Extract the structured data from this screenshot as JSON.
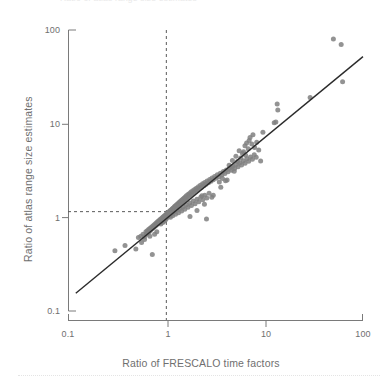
{
  "figure": {
    "top_fragment_text": "Ratio of atlas range size estimates",
    "background_color": "#ffffff",
    "point_color": "#808080",
    "line_color": "#2b2b2b",
    "axis_color": "#7a7a7a",
    "text_color": "#6f6f6f",
    "reference_line_color": "#5a5a5a",
    "separator_color": "#e4e4e4"
  },
  "axes": {
    "y": {
      "title": "Ratio of atlas range size estimates",
      "ticks": [
        "100",
        "10",
        "1",
        "0.1"
      ],
      "tick_values": [
        100,
        10,
        1,
        0.1
      ],
      "scale": "log"
    },
    "x": {
      "title": "Ratio of FRESCALO time factors",
      "ticks": [
        "0.1",
        "1",
        "10",
        "100"
      ],
      "tick_values": [
        0.1,
        1,
        10,
        100
      ],
      "scale": "log"
    }
  },
  "chart_data": {
    "type": "scatter",
    "title": "",
    "subtitle": "",
    "xlabel": "Ratio of FRESCALO time factors",
    "ylabel": "Ratio of atlas range size estimates",
    "xscale": "log",
    "yscale": "log",
    "xlim": [
      0.1,
      100
    ],
    "ylim": [
      0.1,
      100
    ],
    "xticks": [
      0.1,
      1,
      10,
      100
    ],
    "yticks": [
      0.1,
      1,
      10,
      100
    ],
    "xticklabels": [
      "0.1",
      "1",
      "10",
      "100"
    ],
    "yticklabels": [
      "0.1",
      "1",
      "10",
      "100"
    ],
    "grid": false,
    "legend": null,
    "marker": {
      "shape": "circle",
      "color": "#808080",
      "size": 5,
      "alpha": 0.85
    },
    "annotations": [
      {
        "kind": "vline",
        "x": 1,
        "style": "dashed",
        "color": "#5a5a5a"
      },
      {
        "kind": "hline",
        "y": 1.15,
        "style": "dashed",
        "color": "#5a5a5a",
        "x_to": 1
      }
    ],
    "fit_line": {
      "kind": "line",
      "style": "solid",
      "color": "#2b2b2b",
      "x": [
        0.12,
        100
      ],
      "y": [
        0.155,
        52
      ]
    },
    "series": [
      {
        "name": "species",
        "n_points": 214,
        "points": [
          [
            0.3,
            0.44
          ],
          [
            0.38,
            0.5
          ],
          [
            0.49,
            0.46
          ],
          [
            0.72,
            0.4
          ],
          [
            0.52,
            0.61
          ],
          [
            0.55,
            0.63
          ],
          [
            0.58,
            0.66
          ],
          [
            0.6,
            0.62
          ],
          [
            0.62,
            0.7
          ],
          [
            0.63,
            0.66
          ],
          [
            0.64,
            0.72
          ],
          [
            0.65,
            0.68
          ],
          [
            0.66,
            0.74
          ],
          [
            0.67,
            0.7
          ],
          [
            0.68,
            0.76
          ],
          [
            0.69,
            0.73
          ],
          [
            0.7,
            0.78
          ],
          [
            0.71,
            0.75
          ],
          [
            0.72,
            0.8
          ],
          [
            0.73,
            0.77
          ],
          [
            0.74,
            0.82
          ],
          [
            0.75,
            0.79
          ],
          [
            0.76,
            0.84
          ],
          [
            0.77,
            0.81
          ],
          [
            0.78,
            0.86
          ],
          [
            0.79,
            0.83
          ],
          [
            0.8,
            0.88
          ],
          [
            0.81,
            0.85
          ],
          [
            0.82,
            0.9
          ],
          [
            0.83,
            0.87
          ],
          [
            0.84,
            0.92
          ],
          [
            0.85,
            0.89
          ],
          [
            0.86,
            0.94
          ],
          [
            0.87,
            0.91
          ],
          [
            0.88,
            0.96
          ],
          [
            0.89,
            0.93
          ],
          [
            0.9,
            0.98
          ],
          [
            0.91,
            0.95
          ],
          [
            0.92,
            1.0
          ],
          [
            0.93,
            0.97
          ],
          [
            0.94,
            1.02
          ],
          [
            0.95,
            0.99
          ],
          [
            0.96,
            1.04
          ],
          [
            0.97,
            1.01
          ],
          [
            0.98,
            1.06
          ],
          [
            0.99,
            1.03
          ],
          [
            1.0,
            1.08
          ],
          [
            1.01,
            1.05
          ],
          [
            1.02,
            1.1
          ],
          [
            1.03,
            1.07
          ],
          [
            1.04,
            1.12
          ],
          [
            1.05,
            1.09
          ],
          [
            1.06,
            1.14
          ],
          [
            1.07,
            1.11
          ],
          [
            1.08,
            1.16
          ],
          [
            1.09,
            1.13
          ],
          [
            1.1,
            1.18
          ],
          [
            1.11,
            1.15
          ],
          [
            1.12,
            1.2
          ],
          [
            1.13,
            1.17
          ],
          [
            1.14,
            1.22
          ],
          [
            1.15,
            1.19
          ],
          [
            1.16,
            1.24
          ],
          [
            1.17,
            1.21
          ],
          [
            1.18,
            1.26
          ],
          [
            1.19,
            1.23
          ],
          [
            1.2,
            1.28
          ],
          [
            1.21,
            1.25
          ],
          [
            1.22,
            1.31
          ],
          [
            1.23,
            1.27
          ],
          [
            1.25,
            1.34
          ],
          [
            1.26,
            1.3
          ],
          [
            1.28,
            1.37
          ],
          [
            1.29,
            1.32
          ],
          [
            1.31,
            1.4
          ],
          [
            1.32,
            1.35
          ],
          [
            1.34,
            1.43
          ],
          [
            1.35,
            1.38
          ],
          [
            1.37,
            1.46
          ],
          [
            1.38,
            1.41
          ],
          [
            1.4,
            1.49
          ],
          [
            1.42,
            1.44
          ],
          [
            1.44,
            1.53
          ],
          [
            1.46,
            1.47
          ],
          [
            1.48,
            1.57
          ],
          [
            1.5,
            1.51
          ],
          [
            1.52,
            1.61
          ],
          [
            1.54,
            1.55
          ],
          [
            1.56,
            1.65
          ],
          [
            1.58,
            1.59
          ],
          [
            1.6,
            1.7
          ],
          [
            1.63,
            1.63
          ],
          [
            1.66,
            1.75
          ],
          [
            1.69,
            1.68
          ],
          [
            1.72,
            1.8
          ],
          [
            1.75,
            1.73
          ],
          [
            1.78,
            1.86
          ],
          [
            1.82,
            1.78
          ],
          [
            1.86,
            1.92
          ],
          [
            1.9,
            1.84
          ],
          [
            1.94,
            1.98
          ],
          [
            1.98,
            1.9
          ],
          [
            2.02,
            2.05
          ],
          [
            2.07,
            1.96
          ],
          [
            2.12,
            2.12
          ],
          [
            2.17,
            2.03
          ],
          [
            2.22,
            2.2
          ],
          [
            2.28,
            2.1
          ],
          [
            2.34,
            2.28
          ],
          [
            2.4,
            2.18
          ],
          [
            2.46,
            2.36
          ],
          [
            2.53,
            2.26
          ],
          [
            2.6,
            2.45
          ],
          [
            2.68,
            2.34
          ],
          [
            2.76,
            2.54
          ],
          [
            2.84,
            2.43
          ],
          [
            2.92,
            2.63
          ],
          [
            3.0,
            2.52
          ],
          [
            3.1,
            2.73
          ],
          [
            3.2,
            2.62
          ],
          [
            3.3,
            2.84
          ],
          [
            3.42,
            2.72
          ],
          [
            3.54,
            2.96
          ],
          [
            3.66,
            2.83
          ],
          [
            3.8,
            3.08
          ],
          [
            3.94,
            2.94
          ],
          [
            4.08,
            3.21
          ],
          [
            4.24,
            3.06
          ],
          [
            4.4,
            3.35
          ],
          [
            4.58,
            3.18
          ],
          [
            4.76,
            3.5
          ],
          [
            4.95,
            3.32
          ],
          [
            5.15,
            3.66
          ],
          [
            5.36,
            3.46
          ],
          [
            5.58,
            3.83
          ],
          [
            5.82,
            3.61
          ],
          [
            6.06,
            4.01
          ],
          [
            6.32,
            3.78
          ],
          [
            6.6,
            4.21
          ],
          [
            6.88,
            3.96
          ],
          [
            7.18,
            4.42
          ],
          [
            7.5,
            4.16
          ],
          [
            7.84,
            4.65
          ],
          [
            8.2,
            4.37
          ],
          [
            0.88,
            0.85
          ],
          [
            0.92,
            0.88
          ],
          [
            0.95,
            0.91
          ],
          [
            0.98,
            0.94
          ],
          [
            1.0,
            0.97
          ],
          [
            1.02,
            1.0
          ],
          [
            1.05,
            1.03
          ],
          [
            1.08,
            1.06
          ],
          [
            1.1,
            1.0
          ],
          [
            1.13,
            1.1
          ],
          [
            1.16,
            1.04
          ],
          [
            1.2,
            1.14
          ],
          [
            1.24,
            1.08
          ],
          [
            1.28,
            1.19
          ],
          [
            1.33,
            1.12
          ],
          [
            1.38,
            1.24
          ],
          [
            1.43,
            1.17
          ],
          [
            1.48,
            1.3
          ],
          [
            1.54,
            1.22
          ],
          [
            1.6,
            1.36
          ],
          [
            1.66,
            1.28
          ],
          [
            1.73,
            1.42
          ],
          [
            1.8,
            1.34
          ],
          [
            1.88,
            1.49
          ],
          [
            1.96,
            1.4
          ],
          [
            2.05,
            1.56
          ],
          [
            2.14,
            1.47
          ],
          [
            2.24,
            1.64
          ],
          [
            2.35,
            1.54
          ],
          [
            2.46,
            1.72
          ],
          [
            2.58,
            1.61
          ],
          [
            2.72,
            1.81
          ],
          [
            2.56,
            0.96
          ],
          [
            2.3,
            1.7
          ],
          [
            3.0,
            1.72
          ],
          [
            3.46,
            2.38
          ],
          [
            3.72,
            2.6
          ],
          [
            4.0,
            2.46
          ],
          [
            4.6,
            3.46
          ],
          [
            4.9,
            3.1
          ],
          [
            5.3,
            3.95
          ],
          [
            5.7,
            4.3
          ],
          [
            6.1,
            5.0
          ],
          [
            6.3,
            5.8
          ],
          [
            6.55,
            6.2
          ],
          [
            6.8,
            5.4
          ],
          [
            6.95,
            6.6
          ],
          [
            7.1,
            7.1
          ],
          [
            7.4,
            6.05
          ],
          [
            7.6,
            7.6
          ],
          [
            7.9,
            5.55
          ],
          [
            8.3,
            6.35
          ],
          [
            8.7,
            5.25
          ],
          [
            9.1,
            4.0
          ],
          [
            9.6,
            8.1
          ],
          [
            6.4,
            4.6
          ],
          [
            5.95,
            4.8
          ],
          [
            5.5,
            5.15
          ],
          [
            5.1,
            4.5
          ],
          [
            4.7,
            4.05
          ],
          [
            4.35,
            3.6
          ],
          [
            12.5,
            10.2
          ],
          [
            13.0,
            10.4
          ],
          [
            13.6,
            14.0
          ],
          [
            13.4,
            16.2
          ],
          [
            29.0,
            19.0
          ],
          [
            50.0,
            80.0
          ],
          [
            60.0,
            70.0
          ],
          [
            62.0,
            28.0
          ],
          [
            4.15,
            2.5
          ],
          [
            3.58,
            2.1
          ],
          [
            2.9,
            1.64
          ],
          [
            2.44,
            1.38
          ],
          [
            2.05,
            1.18
          ],
          [
            1.74,
            1.02
          ],
          [
            0.8,
            0.7
          ],
          [
            0.76,
            0.66
          ],
          [
            0.68,
            0.63
          ],
          [
            0.6,
            0.58
          ],
          [
            0.56,
            0.54
          ]
        ]
      }
    ]
  },
  "separator": {
    "style": "dotted"
  }
}
